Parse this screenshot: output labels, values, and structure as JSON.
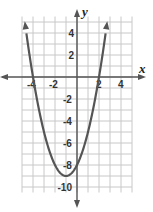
{
  "chart_data": {
    "type": "line",
    "title": "",
    "function": "y = x^2 + 2x - 8",
    "xlabel": "x",
    "ylabel": "y",
    "xlim": [
      -5,
      5
    ],
    "ylim": [
      -10.5,
      5.5
    ],
    "grid": true,
    "x_ticks": [
      -4,
      -2,
      2,
      4
    ],
    "y_ticks": [
      4,
      2,
      -2,
      -4,
      -6,
      -8,
      -10
    ],
    "x_tick_labels": [
      "-4",
      "-2",
      "2",
      "4"
    ],
    "y_tick_labels": [
      "4",
      "2",
      "-2",
      "-4",
      "-6",
      "-8",
      "-10"
    ],
    "key_points": {
      "x_intercepts": [
        [
          -4,
          0
        ],
        [
          2,
          0
        ]
      ],
      "y_intercept": [
        0,
        -8
      ],
      "vertex": [
        -1,
        -9
      ]
    },
    "series": [
      {
        "name": "parabola",
        "x": [
          -4.5,
          -4,
          -3,
          -2,
          -1,
          0,
          1,
          2,
          2.5
        ],
        "y": [
          3.25,
          0,
          -5,
          -8,
          -9,
          -8,
          -5,
          0,
          3.25
        ]
      }
    ],
    "colors": {
      "curve": "#555555",
      "grid": "#c8c8c8",
      "axes": "#555555"
    }
  }
}
